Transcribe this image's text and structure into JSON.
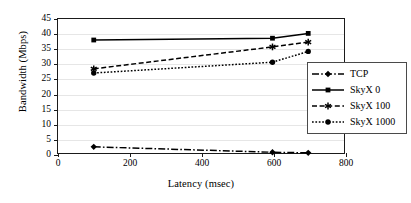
{
  "chart_data": {
    "type": "line",
    "title": "",
    "xlabel": "Latency (msec)",
    "ylabel": "Bandwidth (Mbps)",
    "xlim": [
      0,
      800
    ],
    "ylim": [
      0,
      45
    ],
    "xticks": [
      0,
      200,
      400,
      600,
      800
    ],
    "yticks": [
      0,
      5,
      10,
      15,
      20,
      25,
      30,
      35,
      40,
      45
    ],
    "grid": true,
    "legend_position": "inside-bottom-right",
    "x": [
      100,
      600,
      700
    ],
    "series": [
      {
        "name": "TCP",
        "marker": "diamond",
        "line_style": "dash-dot",
        "color": "#000000",
        "values": [
          2.4,
          0.6,
          0.4
        ]
      },
      {
        "name": "SkyX 0",
        "marker": "square",
        "line_style": "solid",
        "color": "#000000",
        "values": [
          38.0,
          38.6,
          40.2
        ]
      },
      {
        "name": "SkyX 100",
        "marker": "asterisk",
        "line_style": "dashed",
        "color": "#000000",
        "values": [
          28.4,
          35.7,
          37.3
        ]
      },
      {
        "name": "SkyX 1000",
        "marker": "circle",
        "line_style": "dotted",
        "color": "#000000",
        "values": [
          27.0,
          30.6,
          34.2
        ]
      }
    ]
  },
  "legend": {
    "items": [
      {
        "label": "TCP"
      },
      {
        "label": "SkyX 0"
      },
      {
        "label": "SkyX 100"
      },
      {
        "label": "SkyX 1000"
      }
    ]
  },
  "axes": {
    "x_tick_labels": [
      "0",
      "200",
      "400",
      "600",
      "800"
    ],
    "y_tick_labels": [
      "0",
      "5",
      "10",
      "15",
      "20",
      "25",
      "30",
      "35",
      "40",
      "45"
    ],
    "x_axis_title": "Latency (msec)",
    "y_axis_title": "Bandwidth (Mbps)"
  }
}
